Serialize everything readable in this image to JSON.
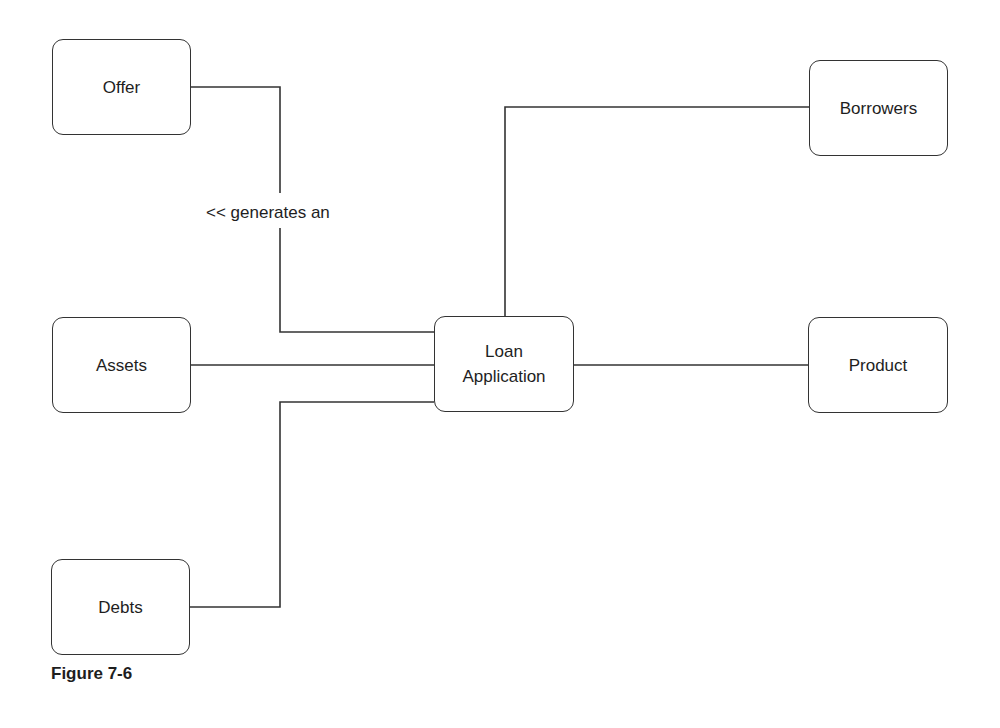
{
  "diagram": {
    "type": "entity-relationship",
    "central_node": "Loan Application",
    "nodes": {
      "offer": "Offer",
      "borrowers": "Borrowers",
      "assets": "Assets",
      "loan_application": "Loan\nApplication",
      "product": "Product",
      "debts": "Debts"
    },
    "edges": [
      {
        "from": "Offer",
        "to": "Loan Application",
        "label": "<< generates an"
      },
      {
        "from": "Borrowers",
        "to": "Loan Application",
        "label": ""
      },
      {
        "from": "Assets",
        "to": "Loan Application",
        "label": ""
      },
      {
        "from": "Product",
        "to": "Loan Application",
        "label": ""
      },
      {
        "from": "Debts",
        "to": "Loan Application",
        "label": ""
      }
    ],
    "edge_labels": {
      "offer_to_loan": "<< generates an"
    },
    "caption": "Figure 7-6"
  },
  "colors": {
    "line": "#333333",
    "text": "#1e1e1e",
    "background": "#ffffff"
  }
}
